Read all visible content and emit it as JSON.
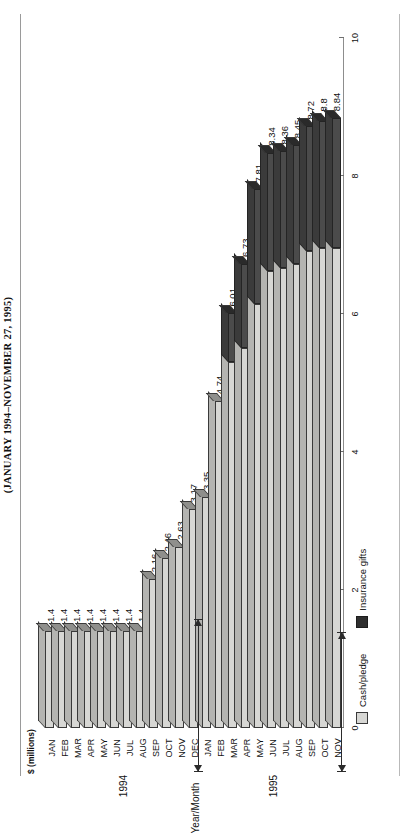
{
  "figure": {
    "caption": "(JANUARY 1994–NOVEMBER 27, 1995)",
    "y_axis_label": "$ (millions)",
    "x_axis_label": "Year/Month"
  },
  "legend": {
    "position": "bottom-left",
    "items": [
      {
        "label": "Cash/pledge",
        "color": "#d7d7d4",
        "key": "cash"
      },
      {
        "label": "Insurance gifts",
        "color": "#2f2f2f",
        "key": "insurance"
      }
    ]
  },
  "year_brackets": [
    {
      "label": "1994",
      "start": "JAN",
      "end": "DEC"
    },
    {
      "label": "1995",
      "start": "JAN",
      "end": "NOV"
    }
  ],
  "chart_data": {
    "type": "bar",
    "orientation": "horizontal",
    "stacked": true,
    "title": "(JANUARY 1994–NOVEMBER 27, 1995)",
    "xlabel": "Year/Month",
    "ylabel": "$ (millions)",
    "ylim": [
      0,
      10
    ],
    "yticks": [
      0,
      2,
      4,
      6,
      8,
      10
    ],
    "ytick_labels": [
      "0",
      "2",
      "4",
      "6",
      "8",
      "10"
    ],
    "grid": false,
    "categories": [
      "JAN",
      "FEB",
      "MAR",
      "APR",
      "MAY",
      "JUN",
      "JUL",
      "AUG",
      "SEP",
      "OCT",
      "NOV",
      "DEC",
      "JAN",
      "FEB",
      "MAR",
      "APR",
      "MAY",
      "JUN",
      "JUL",
      "AUG",
      "SEP",
      "OCT",
      "NOV"
    ],
    "category_years": [
      "1994",
      "1994",
      "1994",
      "1994",
      "1994",
      "1994",
      "1994",
      "1994",
      "1994",
      "1994",
      "1994",
      "1994",
      "1995",
      "1995",
      "1995",
      "1995",
      "1995",
      "1995",
      "1995",
      "1995",
      "1995",
      "1995",
      "1995"
    ],
    "totals": [
      1.4,
      1.4,
      1.4,
      1.4,
      1.4,
      1.4,
      1.4,
      1.4,
      2.16,
      2.46,
      2.63,
      3.17,
      3.35,
      4.74,
      6.01,
      6.73,
      7.81,
      8.34,
      8.36,
      8.45,
      8.72,
      8.8,
      8.84
    ],
    "data_labels": [
      "1.4",
      "1.4",
      "1.4",
      "1.4",
      "1.4",
      "1.4",
      "1.4",
      "1.4",
      "2.16",
      "2.46",
      "2.63",
      "3.17",
      "3.35",
      "4.74",
      "6.01",
      "6.73",
      "7.81",
      "8.34",
      "8.36",
      "8.45",
      "8.72",
      "8.8",
      "8.84"
    ],
    "series": [
      {
        "name": "Cash/pledge",
        "color": "#d7d7d4",
        "values": [
          1.4,
          1.4,
          1.4,
          1.4,
          1.4,
          1.4,
          1.4,
          1.4,
          2.16,
          2.46,
          2.63,
          3.17,
          3.35,
          4.74,
          5.3,
          5.5,
          6.15,
          6.62,
          6.66,
          6.73,
          6.92,
          6.95,
          6.96
        ]
      },
      {
        "name": "Insurance gifts",
        "color": "#2f2f2f",
        "values": [
          0,
          0,
          0,
          0,
          0,
          0,
          0,
          0,
          0,
          0,
          0,
          0,
          0,
          0,
          0.71,
          1.23,
          1.66,
          1.72,
          1.7,
          1.72,
          1.8,
          1.85,
          1.88
        ]
      }
    ]
  }
}
